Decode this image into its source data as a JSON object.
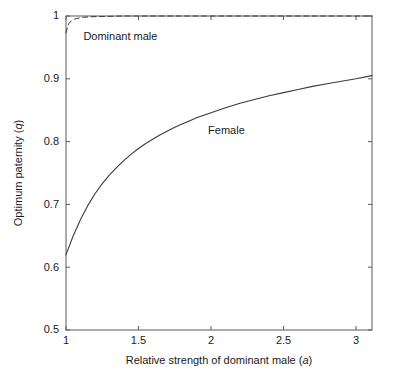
{
  "chart_data": {
    "type": "line",
    "title": "",
    "xlabel": "Relative strength of dominant male (a)",
    "xlabel_plain": "Relative strength of dominant male",
    "xlabel_symbol": "a",
    "ylabel": "Optimum paternity (q)",
    "ylabel_plain": "Optimum paternity",
    "ylabel_symbol": "q",
    "xlim": [
      1,
      3.11
    ],
    "ylim": [
      0.5,
      1.0
    ],
    "xticks": [
      1,
      1.5,
      2,
      2.5,
      3
    ],
    "xticklabels": [
      "1",
      "1.5",
      "2",
      "2.5",
      "3"
    ],
    "yticks": [
      0.5,
      0.6,
      0.7,
      0.8,
      0.9,
      1.0
    ],
    "yticklabels": [
      "0.5",
      "0.6",
      "0.7",
      "0.8",
      "0.9",
      "1"
    ],
    "grid": false,
    "legend_position": "inline-annotations",
    "series": [
      {
        "name": "Dominant male",
        "style": "dashed",
        "color": "#3a3a3a",
        "label_x": 1.12,
        "label_y": 0.962,
        "x": [
          1.0,
          1.01,
          1.02,
          1.04,
          1.07,
          1.12,
          1.2,
          1.4,
          1.7,
          2.0,
          2.4,
          2.8,
          3.11
        ],
        "y": [
          0.973,
          0.982,
          0.988,
          0.993,
          0.996,
          0.998,
          0.999,
          1.0,
          1.0,
          1.0,
          1.0,
          1.0,
          1.0
        ]
      },
      {
        "name": "Female",
        "style": "solid",
        "color": "#3a3a3a",
        "label_x": 1.98,
        "label_y": 0.812,
        "x": [
          1.0,
          1.05,
          1.1,
          1.15,
          1.2,
          1.25,
          1.3,
          1.35,
          1.4,
          1.45,
          1.5,
          1.55,
          1.6,
          1.65,
          1.7,
          1.75,
          1.8,
          1.85,
          1.9,
          1.95,
          2.0,
          2.1,
          2.2,
          2.3,
          2.4,
          2.5,
          2.6,
          2.7,
          2.8,
          2.9,
          3.0,
          3.11
        ],
        "y": [
          0.62,
          0.65,
          0.676,
          0.698,
          0.717,
          0.733,
          0.747,
          0.759,
          0.77,
          0.78,
          0.789,
          0.797,
          0.804,
          0.811,
          0.817,
          0.823,
          0.828,
          0.833,
          0.838,
          0.842,
          0.846,
          0.854,
          0.861,
          0.867,
          0.873,
          0.878,
          0.883,
          0.888,
          0.892,
          0.896,
          0.9,
          0.905
        ]
      }
    ]
  },
  "geometry": {
    "plot_left": 66,
    "plot_right": 372,
    "plot_top": 16,
    "plot_bottom": 330,
    "tick_len": 4,
    "x_title_y": 364,
    "y_title_x": 22
  }
}
